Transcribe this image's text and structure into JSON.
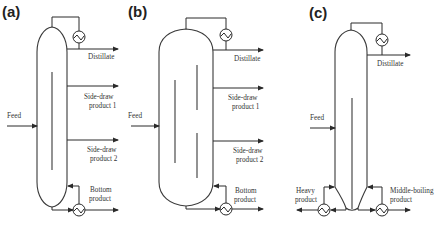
{
  "panels": [
    {
      "id": "a",
      "label": "(a)",
      "feed": "Feed",
      "distillate": "Distillate",
      "side_draw_1": [
        "Side-draw",
        "product 1"
      ],
      "side_draw_2": [
        "Side-draw",
        "product 2"
      ],
      "bottom": [
        "Bottom",
        "product"
      ]
    },
    {
      "id": "b",
      "label": "(b)",
      "feed": "Feed",
      "distillate": "Distillate",
      "side_draw_1": [
        "Side-draw",
        "product 1"
      ],
      "side_draw_2": [
        "Side-draw",
        "product 2"
      ],
      "bottom": [
        "Bottom",
        "product"
      ]
    },
    {
      "id": "c",
      "label": "(c)",
      "feed": "Feed",
      "distillate": "Distillate",
      "heavy": [
        "Heavy",
        "product"
      ],
      "middle": [
        "Middle-boiling",
        "product"
      ]
    }
  ],
  "colors": {
    "line": "#2a2a2a",
    "text": "#333333",
    "background": "#ffffff"
  }
}
